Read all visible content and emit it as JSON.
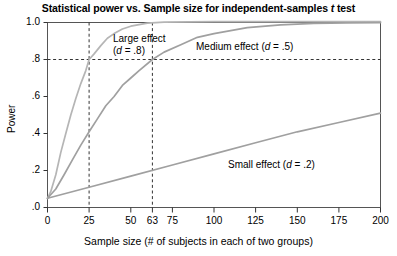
{
  "chart_data": {
    "type": "line",
    "title": "Statistical power vs. Sample size for independent-samples t test",
    "title_italic_token": "t",
    "xlabel": "Sample size (# of subjects in each of two groups)",
    "ylabel": "Power",
    "xlim": [
      0,
      200
    ],
    "ylim": [
      0.0,
      1.0
    ],
    "grid": false,
    "legend_position": "inline-annotations",
    "xticks": [
      0,
      25,
      50,
      63,
      75,
      100,
      125,
      150,
      175,
      200
    ],
    "xticklabels": [
      "0",
      "25",
      "50",
      "63",
      "75",
      "100",
      "125",
      "150",
      "175",
      "200"
    ],
    "yticks": [
      0.0,
      0.2,
      0.4,
      0.6,
      0.8,
      1.0
    ],
    "yticklabels": [
      ".0",
      ".2",
      ".4",
      ".6",
      ".8",
      "1.0"
    ],
    "series": [
      {
        "name": "Large effect (d = .8)",
        "label_line1": "Large effect",
        "label_line2": "(d = .8)",
        "effect_size": 0.8,
        "color": "#b3b3b3",
        "x": [
          0,
          2,
          5,
          8,
          11,
          14,
          17,
          20,
          23,
          25,
          28,
          32,
          36,
          40,
          45,
          50,
          60,
          70,
          85,
          100,
          125,
          150,
          175,
          200
        ],
        "values": [
          0.05,
          0.09,
          0.18,
          0.29,
          0.4,
          0.5,
          0.59,
          0.67,
          0.74,
          0.8,
          0.83,
          0.88,
          0.92,
          0.94,
          0.965,
          0.98,
          0.993,
          0.998,
          0.9996,
          0.9999,
          1.0,
          1.0,
          1.0,
          1.0
        ]
      },
      {
        "name": "Medium effect (d = .5)",
        "label_line1": "Medium effect (d = .5)",
        "effect_size": 0.5,
        "color": "#a0a0a0",
        "x": [
          0,
          5,
          10,
          15,
          20,
          25,
          30,
          35,
          40,
          45,
          50,
          55,
          63,
          70,
          80,
          90,
          100,
          120,
          140,
          160,
          180,
          200
        ],
        "values": [
          0.05,
          0.1,
          0.18,
          0.26,
          0.34,
          0.41,
          0.48,
          0.55,
          0.6,
          0.66,
          0.7,
          0.74,
          0.8,
          0.84,
          0.88,
          0.92,
          0.94,
          0.97,
          0.986,
          0.994,
          0.997,
          0.999
        ]
      },
      {
        "name": "Small effect (d = .2)",
        "label_line1": "Small effect (d = .2)",
        "effect_size": 0.2,
        "color": "#a0a0a0",
        "x": [
          0,
          25,
          50,
          75,
          100,
          125,
          150,
          175,
          200
        ],
        "values": [
          0.05,
          0.11,
          0.17,
          0.23,
          0.29,
          0.35,
          0.41,
          0.46,
          0.51
        ]
      }
    ],
    "reference_lines": [
      {
        "name": "power-threshold",
        "orientation": "horizontal",
        "value": 0.8,
        "style": "dashed"
      },
      {
        "name": "large-effect-n",
        "orientation": "vertical",
        "value": 25,
        "style": "dashed"
      },
      {
        "name": "medium-effect-n",
        "orientation": "vertical",
        "value": 63,
        "style": "dashed"
      }
    ],
    "annotations": [
      {
        "name": "large-effect-label",
        "text_line1": "Large effect",
        "text_line2": "(d = .8)"
      },
      {
        "name": "medium-effect-label",
        "text_line1": "Medium effect (d = .5)"
      },
      {
        "name": "small-effect-label",
        "text_line1": "Small effect (d = .2)"
      }
    ],
    "colors": {
      "axis": "#000000",
      "curve": "#a0a0a0",
      "reference_line": "#333333",
      "background": "#ffffff"
    }
  }
}
